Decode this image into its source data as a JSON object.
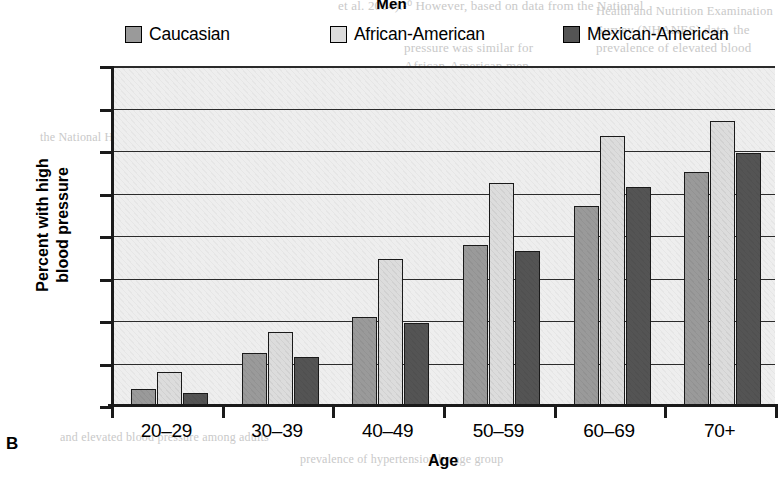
{
  "panel": {
    "label": "B",
    "title": "Men"
  },
  "legend": {
    "position": "top",
    "items": [
      {
        "label": "Caucasian",
        "color": "#9a9a9a"
      },
      {
        "label": "African-American",
        "color": "#dcdcdc"
      },
      {
        "label": "Mexican-American",
        "color": "#545454"
      }
    ]
  },
  "axes": {
    "y_title_line1": "Percent with high",
    "y_title_line2": "blood pressure",
    "x_title": "Age",
    "y_ticks": [
      "80",
      "70",
      "60",
      "50",
      "40",
      "30",
      "20",
      "10",
      "0"
    ]
  },
  "chart_data": {
    "type": "bar",
    "title": "Men",
    "xlabel": "Age",
    "ylabel": "Percent with high blood pressure",
    "ylim": [
      0,
      80
    ],
    "ytick_step": 10,
    "grid": true,
    "legend_position": "top",
    "categories": [
      "20–29",
      "30–39",
      "40–49",
      "50–59",
      "60–69",
      "70+"
    ],
    "series": [
      {
        "name": "Caucasian",
        "color": "#9a9a9a",
        "values": [
          4.0,
          12.5,
          21.0,
          38.0,
          47.0,
          55.0
        ]
      },
      {
        "name": "African-American",
        "color": "#dcdcdc",
        "values": [
          8.0,
          17.5,
          34.5,
          52.5,
          63.5,
          67.0
        ]
      },
      {
        "name": "Mexican-American",
        "color": "#545454",
        "values": [
          3.0,
          11.5,
          19.5,
          36.5,
          51.5,
          59.5
        ]
      }
    ]
  },
  "background_artifacts": [
    "Men",
    "et al. 2004).²⁰ However, based on data from the National",
    "Health and Nutrition Examination Survey (NHANES) data",
    "collected from 1999 to 2004, the prevalence of elevated",
    "blood pressure was similar for African-American and",
    "Mexican-American men but greater in",
    "African-American women than in",
    "Mexican-American and Caucasian",
    "Women",
    "Caucasian    African-American    Mexican-American"
  ]
}
